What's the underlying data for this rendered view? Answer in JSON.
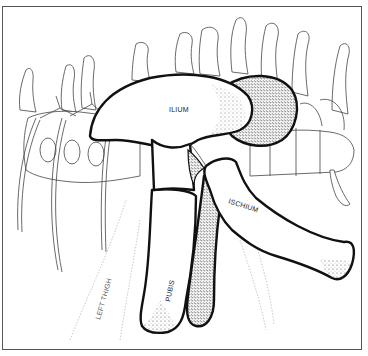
{
  "figure": {
    "labels": {
      "ilium": "ILIUM",
      "ischium": "ISCHIUM",
      "pubis": "PUBIS",
      "left_thigh": "LEFT THIGH"
    }
  },
  "colors": {
    "bone_outline": "#111111",
    "stipple": "#333333",
    "vertebra_line": "#444444",
    "frame_border": "#555555",
    "background": "#ffffff"
  }
}
